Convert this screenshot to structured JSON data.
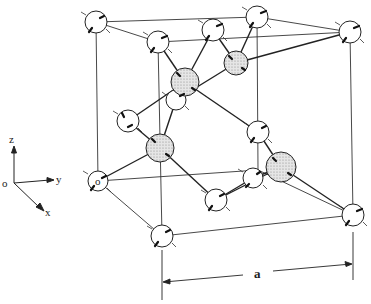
{
  "figure": {
    "type": "crystal-lattice-diagram",
    "axes": {
      "z": "z",
      "y": "y",
      "x": "x",
      "origin": "o"
    },
    "dimension_label": "a",
    "colors": {
      "line": "#222222",
      "white_atom": "#ffffff",
      "shaded_atom": "#d8d8d8"
    }
  }
}
